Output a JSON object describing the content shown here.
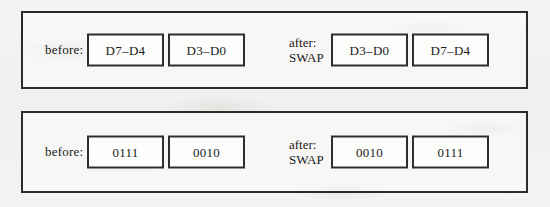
{
  "figure": {
    "type": "swap-instruction-diagram",
    "background_color": "#f3f2f0",
    "ink_color": "#2b2b2b"
  },
  "panels": [
    {
      "id": "panel-1",
      "before_label": "before:",
      "after_label_line1": "after:",
      "after_label_line2": "SWAP",
      "before_boxes": [
        "D7–D4",
        "D3–D0"
      ],
      "after_boxes": [
        "D3–D0",
        "D7–D4"
      ]
    },
    {
      "id": "panel-2",
      "before_label": "before:",
      "after_label_line1": "after:",
      "after_label_line2": "SWAP",
      "before_boxes": [
        "0111",
        "0010"
      ],
      "after_boxes": [
        "0010",
        "0111"
      ]
    }
  ]
}
